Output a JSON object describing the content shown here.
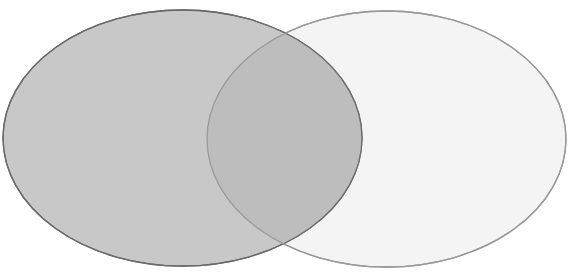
{
  "diagram": {
    "type": "venn",
    "sets": [
      {
        "id": "set-a",
        "label": "",
        "cx": 182.5,
        "cy": 138,
        "rx": 179.5,
        "ry": 128,
        "fill": "#c8c8c8",
        "stroke": "#6a6a6a"
      },
      {
        "id": "set-b",
        "label": "",
        "cx": 386.5,
        "cy": 139,
        "rx": 179.5,
        "ry": 128,
        "fill": "#f4f4f4",
        "stroke": "#9a9a9a"
      }
    ],
    "intersection": {
      "fill": "#bdbdbd",
      "label": ""
    },
    "background": "#ffffff"
  }
}
